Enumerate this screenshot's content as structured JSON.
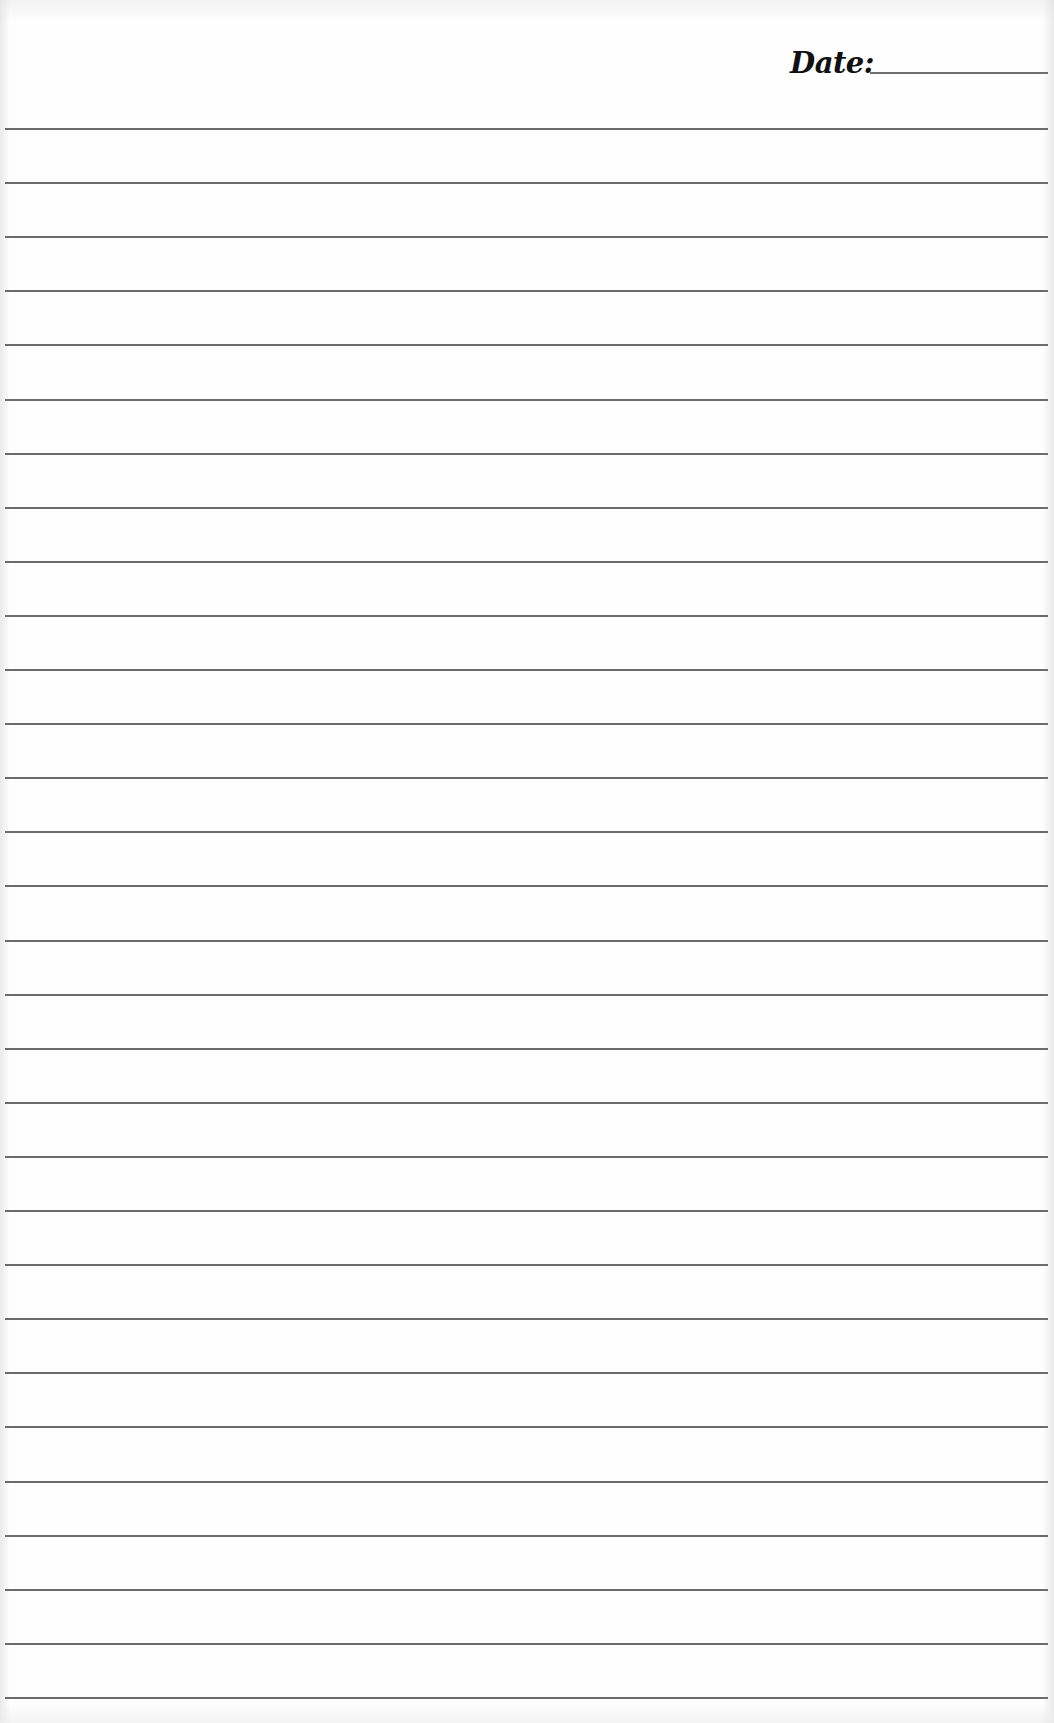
{
  "document": {
    "type": "lined-notebook-page",
    "background_color": "#fefefe",
    "rule_color": "#6c6c6c"
  },
  "header": {
    "date_label": "Date:",
    "date_value": ""
  },
  "rules": {
    "count": 30,
    "first_y": 128,
    "spacing": 54.1
  }
}
